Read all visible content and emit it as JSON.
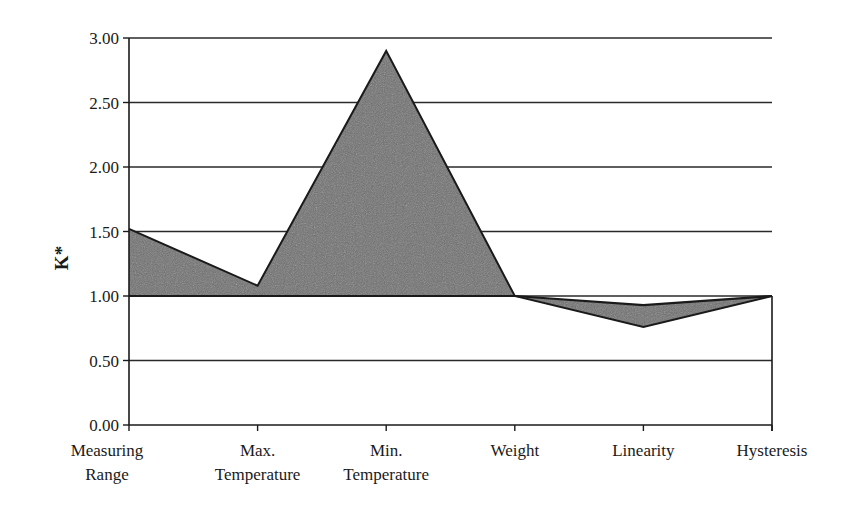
{
  "chart_data": {
    "type": "area",
    "title": "",
    "xlabel": "",
    "ylabel": "K*",
    "ylim": [
      0,
      3
    ],
    "yticks": [
      "0.00",
      "0.50",
      "1.00",
      "1.50",
      "2.00",
      "2.50",
      "3.00"
    ],
    "grid": true,
    "legend": "none",
    "categories": [
      [
        "Measuring",
        "Range"
      ],
      [
        "Max.",
        "Temperature"
      ],
      [
        "Min.",
        "Temperature"
      ],
      [
        "Weight"
      ],
      [
        "Linearity"
      ],
      [
        "Hysteresis"
      ]
    ],
    "series": [
      {
        "name": "K*",
        "values": [
          1.52,
          1.08,
          2.9,
          1.0,
          0.76,
          1.0
        ]
      },
      {
        "name": "Reference",
        "values": [
          1.0,
          1.0,
          1.0,
          1.0,
          0.93,
          1.0
        ]
      }
    ],
    "fill_color": "#6e6e6e",
    "line_color": "#1a1a1a",
    "grid_color": "#2a2a2a"
  }
}
